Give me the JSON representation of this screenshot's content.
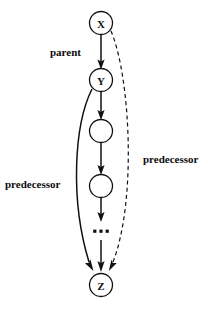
{
  "figure": {
    "type": "directed-graph-diagram",
    "background_color": "#ffffff",
    "ink_color": "#111111",
    "nodes": [
      {
        "id": "x",
        "label": "X",
        "cx": 101,
        "cy": 23,
        "r": 11.5,
        "filled": false
      },
      {
        "id": "y",
        "label": "Y",
        "cx": 101,
        "cy": 80,
        "r": 11.5,
        "filled": false
      },
      {
        "id": "m1",
        "label": "",
        "cx": 101,
        "cy": 131,
        "r": 11.5,
        "filled": false
      },
      {
        "id": "m2",
        "label": "",
        "cx": 101,
        "cy": 186,
        "r": 11.5,
        "filled": false
      },
      {
        "id": "z",
        "label": "Z",
        "cx": 101,
        "cy": 285,
        "r": 11.5,
        "filled": false
      }
    ],
    "ellipsis": {
      "label": "...",
      "cx": 101,
      "cy": 232,
      "dots": 3
    },
    "edges": [
      {
        "id": "x-to-y",
        "from": "x",
        "to": "y",
        "style": "solid",
        "label": "parent"
      },
      {
        "id": "y-to-m1",
        "from": "y",
        "to": "m1",
        "style": "solid",
        "label": ""
      },
      {
        "id": "m1-to-m2",
        "from": "m1",
        "to": "m2",
        "style": "solid",
        "label": ""
      },
      {
        "id": "m2-to-ellipsis",
        "from": "m2",
        "to": "ellipsis",
        "style": "solid",
        "label": ""
      },
      {
        "id": "ellipsis-to-z",
        "from": "ellipsis",
        "to": "z",
        "style": "solid",
        "label": ""
      },
      {
        "id": "y-to-z",
        "from": "y",
        "to": "z",
        "style": "solid-curve",
        "label": "predecessor"
      },
      {
        "id": "x-to-z",
        "from": "x",
        "to": "z",
        "style": "dashed-curve",
        "label": "predecessor"
      }
    ],
    "labels": {
      "parent": "parent",
      "predecessor_left": "predecessor",
      "predecessor_right": "predecessor"
    }
  }
}
